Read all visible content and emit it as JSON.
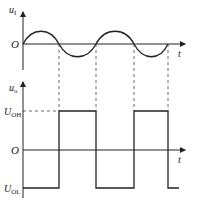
{
  "diagram": {
    "top_panel": {
      "y_label": "u",
      "y_label_sub": "I",
      "origin_label": "O",
      "x_label": "t",
      "waveform": "sine",
      "zero_crossings_x": [
        23,
        59,
        96,
        134,
        168
      ]
    },
    "bottom_panel": {
      "y_label": "u",
      "y_label_sub": "o",
      "high_label": "U",
      "high_label_sub": "OH",
      "origin_label": "O",
      "low_label": "U",
      "low_label_sub": "OL",
      "x_label": "t",
      "waveform": "square",
      "levels_sequence": [
        "low",
        "high",
        "low",
        "high",
        "low"
      ]
    },
    "colors": {
      "line": "#222222",
      "dashed": "#444444",
      "background": "#ffffff"
    }
  }
}
